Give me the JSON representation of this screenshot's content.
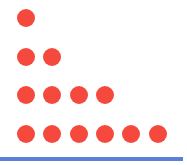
{
  "colors": {
    "dot": "#F5493E",
    "baseline": "#5B7FD9",
    "background": "#ffffff"
  },
  "rows": [
    {
      "count": 1,
      "cy": 18
    },
    {
      "count": 2,
      "cy": 57
    },
    {
      "count": 4,
      "cy": 95
    },
    {
      "count": 6,
      "cy": 134
    }
  ],
  "layout": {
    "start_cx": 26,
    "step_x": 26.3,
    "dot_diameter": 18
  }
}
